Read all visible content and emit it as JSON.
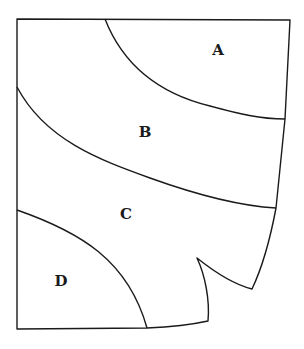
{
  "diagram": {
    "type": "region-map",
    "regions": [
      {
        "id": "A",
        "label": "A",
        "x": 218,
        "y": 50
      },
      {
        "id": "B",
        "label": "B",
        "x": 145,
        "y": 132
      },
      {
        "id": "C",
        "label": "C",
        "x": 126,
        "y": 214
      },
      {
        "id": "D",
        "label": "D",
        "x": 61,
        "y": 281
      }
    ],
    "stroke_color": "#1a1a1a",
    "background": "#ffffff"
  }
}
